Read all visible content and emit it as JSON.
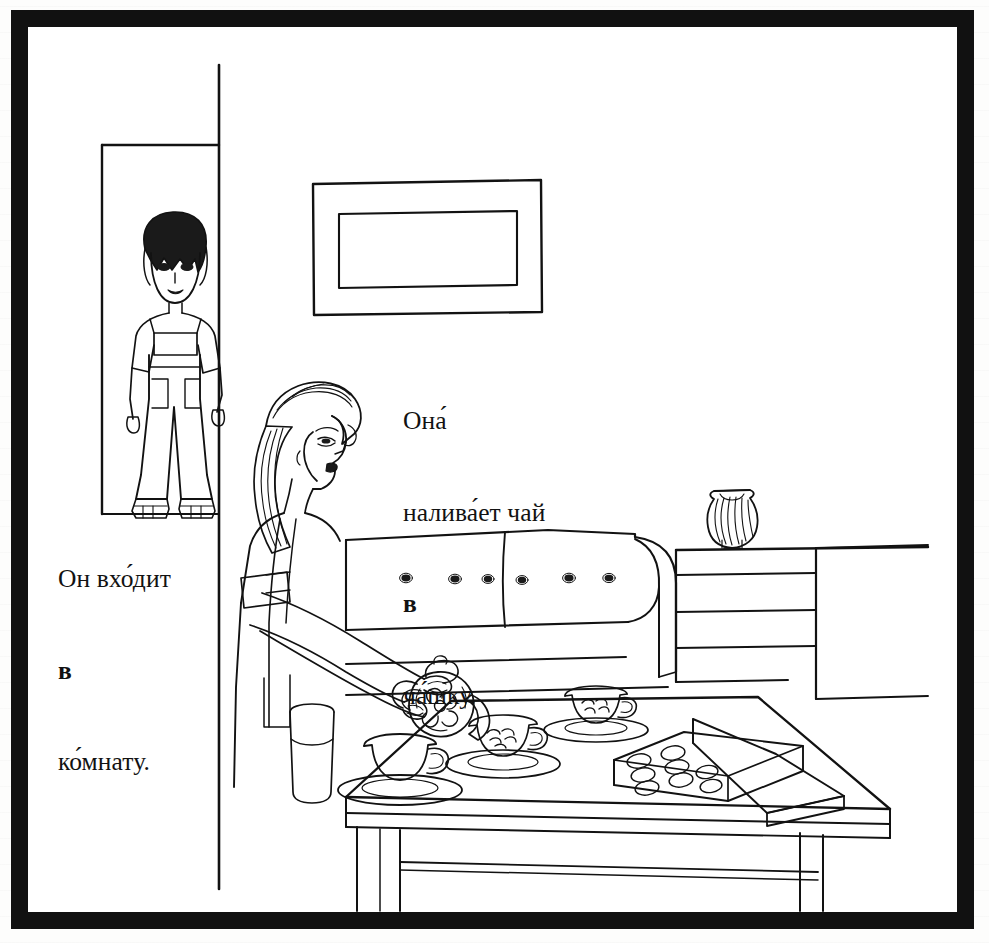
{
  "page": {
    "kind": "textbook-illustration",
    "language": "Russian",
    "width": 989,
    "height": 943,
    "border_color": "#111111",
    "ink_color": "#121212",
    "paper_color": "#ffffff"
  },
  "captions": {
    "left": {
      "name": "caption-he-enters-the-room",
      "line1": "Он вхо́дит",
      "line2_bold": "в",
      "line3": "ко́мнату.",
      "translation_hint": "He enters the room."
    },
    "right": {
      "name": "caption-she-pours-tea",
      "line1": "Она́",
      "line2": "налива́ет чай",
      "line3_bold": "в",
      "line4": "ча́шку.",
      "translation_hint": "She pours tea into the cup."
    }
  },
  "scene": {
    "title": "Living room: woman pouring tea, boy entering through doorway",
    "objects": [
      {
        "name": "doorway",
        "label": "doorway"
      },
      {
        "name": "wall-corner",
        "label": "wall corner edge"
      },
      {
        "name": "boy-figure",
        "label": "boy in overalls standing in doorway"
      },
      {
        "name": "picture-frame",
        "label": "empty framed picture on wall"
      },
      {
        "name": "woman-figure",
        "label": "woman in apron pouring tea"
      },
      {
        "name": "sofa",
        "label": "tufted sofa with six buttons"
      },
      {
        "name": "sideboard",
        "label": "sideboard with drawer lines"
      },
      {
        "name": "vase",
        "label": "fluted vase on sideboard"
      },
      {
        "name": "table",
        "label": "low table with legs and stretcher rail"
      },
      {
        "name": "teapot",
        "label": "floral teapot being tipped to pour"
      },
      {
        "name": "cup-patterned-near",
        "label": "patterned teacup with saucer"
      },
      {
        "name": "cup-patterned-far",
        "label": "patterned teacup with saucer"
      },
      {
        "name": "cup-plain",
        "label": "plain teacup with saucer"
      },
      {
        "name": "chocolate-box",
        "label": "open box of chocolates with lid"
      },
      {
        "name": "tumbler",
        "label": "drinking glass"
      }
    ],
    "counts": {
      "sofa_buttons": 6,
      "cups": 3,
      "chocolate_rows": 4,
      "chocolate_columns": 2,
      "sideboard_lines": 4
    }
  }
}
